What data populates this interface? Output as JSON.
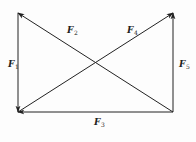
{
  "diagram": {
    "type": "force-vector-rectangle",
    "stroke_color": "#222222",
    "background": "#fdfdfd",
    "points": {
      "top_left": [
        18,
        13
      ],
      "bottom_left": [
        18,
        112
      ],
      "bottom_right": [
        173,
        112
      ],
      "top_right": [
        173,
        13
      ]
    },
    "vectors": [
      {
        "id": "F1",
        "symbol": "F",
        "subscript": "1",
        "from": "top_left",
        "to": "bottom_left",
        "label_pos": [
          8,
          60
        ]
      },
      {
        "id": "F2",
        "symbol": "F",
        "subscript": "2",
        "from": "bottom_right",
        "to": "top_left",
        "label_pos": [
          67,
          26
        ]
      },
      {
        "id": "F3",
        "symbol": "F",
        "subscript": "3",
        "from": "bottom_right",
        "to": "bottom_left",
        "label_pos": [
          94,
          118
        ]
      },
      {
        "id": "F4",
        "symbol": "F",
        "subscript": "4",
        "from": "bottom_left",
        "to": "top_right",
        "label_pos": [
          127,
          26
        ]
      },
      {
        "id": "F5",
        "symbol": "F",
        "subscript": "5",
        "from": "bottom_right",
        "to": "top_right",
        "label_pos": [
          179,
          60
        ]
      }
    ]
  },
  "labels": {
    "f1": {
      "main": "F",
      "sub": "1"
    },
    "f2": {
      "main": "F",
      "sub": "2"
    },
    "f3": {
      "main": "F",
      "sub": "3"
    },
    "f4": {
      "main": "F",
      "sub": "4"
    },
    "f5": {
      "main": "F",
      "sub": "5"
    }
  }
}
